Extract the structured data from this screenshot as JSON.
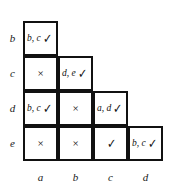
{
  "figure": {
    "name": "pairwise-comparison-staircase-table",
    "row_labels": [
      "b",
      "c",
      "d",
      "e"
    ],
    "col_labels": [
      "a",
      "b",
      "c",
      "d"
    ],
    "symbols": {
      "check": "✓",
      "cross": "×"
    },
    "colors": {
      "ink": "#111111",
      "background": "#ffffff"
    },
    "rows": [
      {
        "label": "b",
        "cells": [
          {
            "col": "a",
            "text": "b, c",
            "mark": "✓",
            "kind": "labelled"
          }
        ]
      },
      {
        "label": "c",
        "cells": [
          {
            "col": "a",
            "text": "",
            "mark": "×",
            "kind": "cross"
          },
          {
            "col": "b",
            "text": "d, e",
            "mark": "✓",
            "kind": "labelled"
          }
        ]
      },
      {
        "label": "d",
        "cells": [
          {
            "col": "a",
            "text": "b, c",
            "mark": "✓",
            "kind": "labelled"
          },
          {
            "col": "b",
            "text": "",
            "mark": "×",
            "kind": "cross"
          },
          {
            "col": "c",
            "text": "a, d",
            "mark": "✓",
            "kind": "labelled"
          }
        ]
      },
      {
        "label": "e",
        "cells": [
          {
            "col": "a",
            "text": "",
            "mark": "×",
            "kind": "cross"
          },
          {
            "col": "b",
            "text": "",
            "mark": "×",
            "kind": "cross"
          },
          {
            "col": "c",
            "text": "",
            "mark": "✓",
            "kind": "check-only"
          },
          {
            "col": "d",
            "text": "b, c",
            "mark": "✓",
            "kind": "labelled"
          }
        ]
      }
    ]
  }
}
